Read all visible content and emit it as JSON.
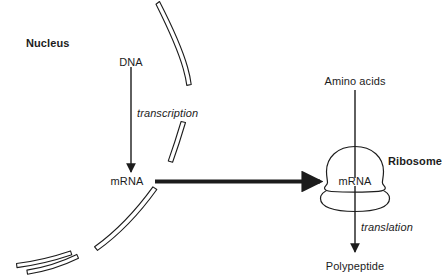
{
  "diagram": {
    "colors": {
      "stroke": "#1c1c1c",
      "text": "#1c1c1c",
      "background": "#ffffff"
    },
    "labels": {
      "nucleus": "Nucleus",
      "dna": "DNA",
      "transcription": "transcription",
      "mrna_nucleus": "mRNA",
      "mrna_ribosome": "mRNA",
      "amino_acids": "Amino acids",
      "ribosome": "Ribosome",
      "translation": "translation",
      "polypeptide": "Polypeptide"
    },
    "arrows": [
      {
        "name": "transcription-arrow",
        "from": "DNA",
        "to": "mRNA",
        "orientation": "vertical-down"
      },
      {
        "name": "mrna-export-arrow",
        "from": "mRNA",
        "to": "Ribosome",
        "orientation": "horizontal-right"
      },
      {
        "name": "amino-acids-arrow",
        "from": "Amino acids",
        "to": "Ribosome",
        "orientation": "vertical-down"
      },
      {
        "name": "translation-arrow",
        "from": "Ribosome",
        "to": "Polypeptide",
        "orientation": "vertical-down"
      }
    ],
    "structures": [
      {
        "name": "nuclear-envelope",
        "description": "segmented curved double-line membrane"
      },
      {
        "name": "ribosome-shape",
        "description": "large dome subunit over small rounded subunit"
      }
    ]
  }
}
